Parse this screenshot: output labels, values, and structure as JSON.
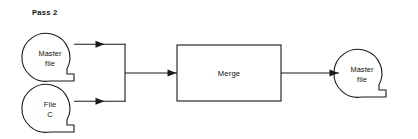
{
  "diagram": {
    "title_label": "Pass 2",
    "colors": {
      "stroke": "#1a1a1a",
      "text": "#111111",
      "background": "#ffffff"
    },
    "nodes": [
      {
        "id": "master-file-input",
        "shape": "magnetic-tape",
        "line1": "Master",
        "line2": "file",
        "cx": 50,
        "cy": 57,
        "r": 24
      },
      {
        "id": "file-c-input",
        "shape": "magnetic-tape",
        "line1": "File",
        "line2": "C",
        "cx": 50,
        "cy": 108,
        "r": 24
      },
      {
        "id": "merge-process",
        "shape": "rectangle",
        "label": "Merge",
        "x": 177,
        "y": 45,
        "width": 104,
        "height": 56
      },
      {
        "id": "master-file-output",
        "shape": "magnetic-tape",
        "line1": "Master",
        "line2": "file",
        "cx": 362,
        "cy": 73,
        "r": 24
      }
    ],
    "connectors": [
      {
        "id": "master-file-to-bus",
        "from": "master-file-input",
        "to": "merge-bus",
        "arrow": true
      },
      {
        "id": "file-c-to-bus",
        "from": "file-c-input",
        "to": "merge-bus",
        "arrow": true
      },
      {
        "id": "bus-to-merge",
        "from": "merge-bus",
        "to": "merge-process",
        "arrow": true
      },
      {
        "id": "merge-to-master-file",
        "from": "merge-process",
        "to": "master-file-output",
        "arrow": true
      }
    ]
  }
}
